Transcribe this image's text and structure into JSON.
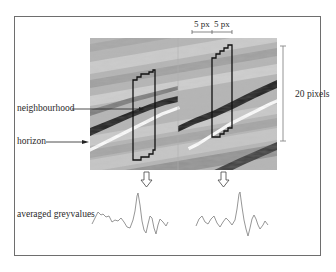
{
  "figure": {
    "labels": {
      "neighbourhood": "neighbourhood",
      "horizon": "horizon",
      "averaged_greyvalues": "averaged greyvalues",
      "scale_vertical": "20 pixels",
      "scale_left": "5 px",
      "scale_right": "5 px"
    },
    "panels": [
      {
        "name": "left-seismic-panel",
        "neighbourhood_window": "irregular stepped column following horizon"
      },
      {
        "name": "right-seismic-panel",
        "neighbourhood_window": "irregular stepped column following horizon"
      }
    ],
    "colors": {
      "frame": "#6e6e6e",
      "neighbourhood_outline": "#111111",
      "horizon": "#ffffff",
      "dark_reflector": "#1a1a1a",
      "waveform": "#8a8a8a",
      "scale_bar": "#888888"
    },
    "icons": {
      "arrow_down_left": "hollow-down-arrow",
      "arrow_down_right": "hollow-down-arrow"
    }
  }
}
